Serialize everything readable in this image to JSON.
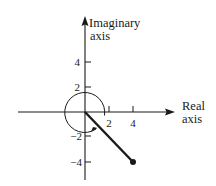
{
  "diagram": {
    "type": "complex-plane",
    "axes": {
      "real_label_line1": "Real",
      "real_label_line2": "axis",
      "imag_label_line1": "Imaginary",
      "imag_label_line2": "axis"
    },
    "real_ticks": [
      {
        "value": 2,
        "label": "2"
      },
      {
        "value": 4,
        "label": "4"
      }
    ],
    "imag_ticks": [
      {
        "value": 4,
        "label": "4"
      },
      {
        "value": 2,
        "label": "2"
      },
      {
        "value": -2,
        "label": "−2"
      },
      {
        "value": -4,
        "label": "−4"
      }
    ],
    "point": {
      "re": 4,
      "im": -4
    },
    "circle_radius_units": 1.7,
    "arc_direction": "clockwise-arrow",
    "colors": {
      "ink": "#1a1a1a",
      "background": "#ffffff"
    }
  }
}
